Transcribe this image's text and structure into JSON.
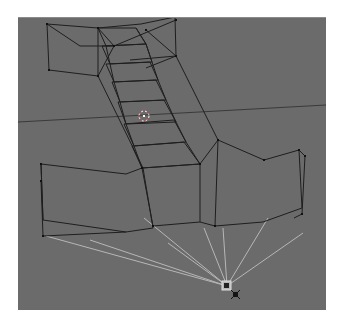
{
  "header": {
    "left_text": "",
    "right_text": ""
  },
  "viewport": {
    "background_color": "#6b6b6b",
    "wire_color": "#1e1e1e",
    "vertex_color": "#111111",
    "light_ray_color": "#c8c8c8",
    "horizon_color": "#3a3a3a",
    "cursor_color": "#ffffff",
    "objects": [
      {
        "name": "top-crossbar",
        "type": "mesh-wireframe"
      },
      {
        "name": "central-shaft",
        "type": "mesh-wireframe"
      },
      {
        "name": "bottom-crossbar",
        "type": "mesh-wireframe"
      },
      {
        "name": "lamp",
        "type": "light"
      }
    ],
    "cursor_3d": {
      "x": 144,
      "y": 115
    },
    "lamp": {
      "x": 227,
      "y": 285
    }
  }
}
